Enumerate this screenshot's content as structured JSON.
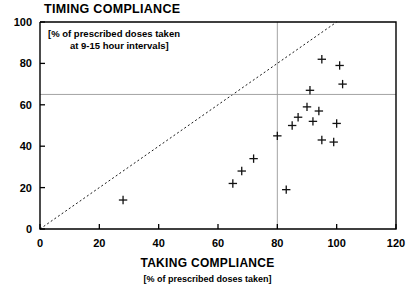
{
  "chart_data": {
    "type": "scatter",
    "title": "TIMING COMPLIANCE",
    "annotation_line1": "[% of prescribed doses taken",
    "annotation_line2": "at 9-15 hour intervals]",
    "xlabel": "TAKING COMPLIANCE",
    "xlabel_sub": "[% of prescribed doses taken]",
    "ylabel": "",
    "xlim": [
      0,
      120
    ],
    "ylim": [
      0,
      100
    ],
    "xticks": [
      0,
      20,
      40,
      60,
      80,
      100,
      120
    ],
    "yticks": [
      0,
      20,
      40,
      60,
      80,
      100
    ],
    "grid": false,
    "legend": "none",
    "marker": "plus",
    "reference_lines": [
      {
        "name": "identity-line",
        "type": "diagonal",
        "style": "dashed",
        "from": [
          0,
          0
        ],
        "to": [
          100,
          100
        ]
      },
      {
        "name": "timing-threshold-line",
        "type": "horizontal",
        "style": "solid",
        "value": 65
      },
      {
        "name": "taking-threshold-line",
        "type": "vertical",
        "style": "solid",
        "value": 80
      }
    ],
    "points": [
      {
        "x": 28,
        "y": 14
      },
      {
        "x": 65,
        "y": 22
      },
      {
        "x": 68,
        "y": 28
      },
      {
        "x": 72,
        "y": 34
      },
      {
        "x": 80,
        "y": 45
      },
      {
        "x": 83,
        "y": 19
      },
      {
        "x": 85,
        "y": 50
      },
      {
        "x": 87,
        "y": 54
      },
      {
        "x": 90,
        "y": 59
      },
      {
        "x": 91,
        "y": 67
      },
      {
        "x": 92,
        "y": 52
      },
      {
        "x": 94,
        "y": 57
      },
      {
        "x": 95,
        "y": 82
      },
      {
        "x": 95,
        "y": 43
      },
      {
        "x": 99,
        "y": 42
      },
      {
        "x": 100,
        "y": 51
      },
      {
        "x": 101,
        "y": 79
      },
      {
        "x": 102,
        "y": 70
      }
    ]
  },
  "geometry": {
    "plot_left": 40,
    "plot_right": 396,
    "plot_top": 22,
    "plot_bottom": 229
  }
}
